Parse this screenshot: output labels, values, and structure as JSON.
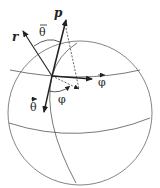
{
  "diagram": {
    "type": "spherical-coordinates-vectors",
    "labels": {
      "r": "r",
      "p": "p",
      "theta_bar": "θ",
      "theta_vec": "θ",
      "phi_vec": "φ",
      "phi_angle": "φ"
    },
    "colors": {
      "stroke": "#333333",
      "sphere": "#666666",
      "text": "#222222",
      "background": "#ffffff"
    }
  }
}
